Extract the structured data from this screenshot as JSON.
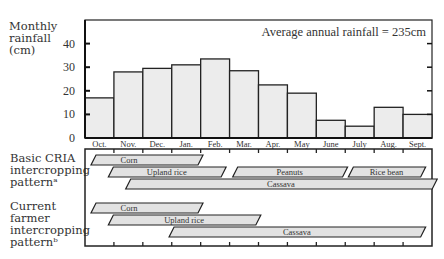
{
  "chart_data": {
    "type": "bar",
    "title": "",
    "ylabel": "Monthly rainfall (cm)",
    "xlabel": "",
    "annotation": "Average annual rainfall = 235cm",
    "ylim": [
      0,
      50
    ],
    "yticks": [
      0,
      10,
      20,
      30,
      40
    ],
    "categories": [
      "Oct.",
      "Nov.",
      "Dec.",
      "Jan.",
      "Feb.",
      "Mar.",
      "Apr.",
      "May",
      "June",
      "July",
      "Aug.",
      "Sept."
    ],
    "values": [
      17,
      28,
      29.5,
      31,
      33.5,
      28.5,
      22.5,
      19,
      7.5,
      5,
      13,
      10
    ],
    "grid": false,
    "bar_color": "#ececec"
  },
  "labels": {
    "ylabel_lines": [
      "Monthly",
      "rainfall",
      "(cm)"
    ],
    "basic_lines": [
      "Basic CRIA",
      "intercropping",
      "patternᵃ"
    ],
    "current_lines": [
      "Current",
      "farmer",
      "intercropping",
      "patternᵇ"
    ]
  },
  "patterns": {
    "basic": [
      {
        "crop": "Corn",
        "start_month": 0.0,
        "end_month": 3.7,
        "row": 0
      },
      {
        "crop": "Upland rice",
        "start_month": 0.6,
        "end_month": 4.5,
        "row": 1
      },
      {
        "crop": "Peanuts",
        "start_month": 4.9,
        "end_month": 8.7,
        "row": 1
      },
      {
        "crop": "Rice bean",
        "start_month": 8.9,
        "end_month": 11.4,
        "row": 1
      },
      {
        "crop": "Cassava",
        "start_month": 1.2,
        "end_month": 11.8,
        "row": 2
      }
    ],
    "current": [
      {
        "crop": "Corn",
        "start_month": 0.0,
        "end_month": 3.7,
        "row": 0
      },
      {
        "crop": "Upland rice",
        "start_month": 0.6,
        "end_month": 5.7,
        "row": 1
      },
      {
        "crop": "Cassava",
        "start_month": 2.7,
        "end_month": 11.4,
        "row": 2
      }
    ]
  }
}
